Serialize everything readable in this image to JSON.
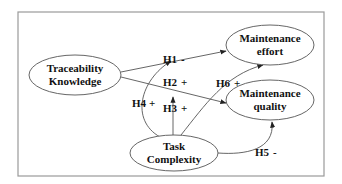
{
  "diagram": {
    "type": "research-model",
    "colors": {
      "stroke": "#555555",
      "frame": "#9a9a9a",
      "text": "#111111",
      "background": "#ffffff"
    },
    "nodes": {
      "traceability": {
        "line1": "Traceability",
        "line2": "Knowledge"
      },
      "effort": {
        "line1": "Maintenance",
        "line2": "effort"
      },
      "quality": {
        "line1": "Maintenance",
        "line2": "quality"
      },
      "complexity": {
        "line1": "Task",
        "line2": "Complexity"
      }
    },
    "hypotheses": {
      "h1": {
        "id": "H1",
        "sign": "-",
        "from": "Traceability Knowledge",
        "to": "Maintenance effort"
      },
      "h2": {
        "id": "H2",
        "sign": "+",
        "from": "Traceability Knowledge",
        "to": "Maintenance quality"
      },
      "h3": {
        "id": "H3",
        "sign": "+",
        "from": "Task Complexity",
        "to": "H2 relationship"
      },
      "h4": {
        "id": "H4",
        "sign": "+",
        "from": "Task Complexity",
        "to": "H1 relationship"
      },
      "h5": {
        "id": "H5",
        "sign": "-",
        "from": "Task Complexity",
        "to": "Maintenance quality"
      },
      "h6": {
        "id": "H6",
        "sign": "+",
        "from": "Task Complexity",
        "to": "Maintenance effort"
      }
    }
  }
}
